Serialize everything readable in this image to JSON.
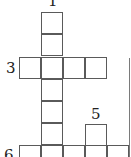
{
  "puzzle": {
    "type": "crossword-grid",
    "clue_numbers": [
      {
        "id": "clue-1",
        "label": "1"
      },
      {
        "id": "clue-3",
        "label": "3"
      },
      {
        "id": "clue-5",
        "label": "5"
      },
      {
        "id": "clue-6",
        "label": "6"
      }
    ],
    "cell_size_px": 22,
    "line_color": "#5a5a5a"
  }
}
